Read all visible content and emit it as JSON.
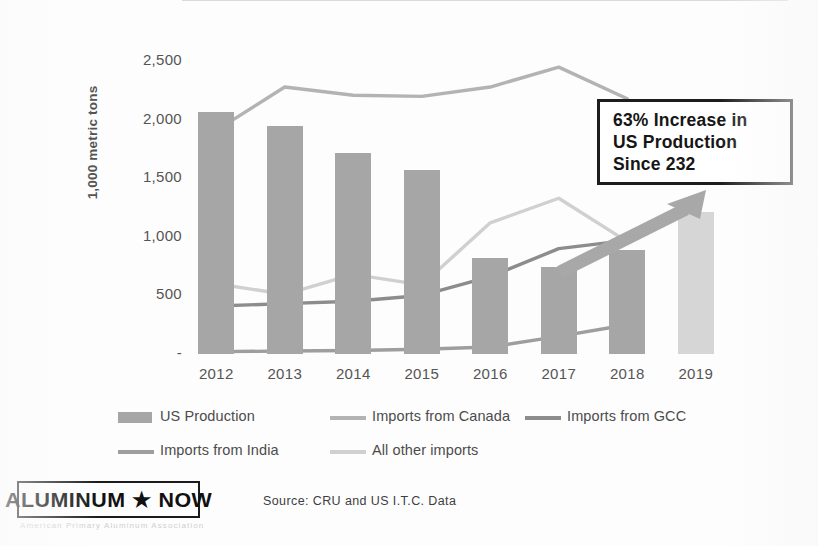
{
  "colors": {
    "us_production_bar": "#a6a6a6",
    "us_production_bar_2019": "#d6d6d6",
    "canada_line": "#b3b3b3",
    "gcc_line": "#8c8c8c",
    "india_line": "#9e9e9e",
    "all_other_line": "#d0d0d0",
    "arrow": "#a8a8a8",
    "callout_border": "#1d1d1d",
    "background": "#ffffff",
    "axis": "#d9d9d9"
  },
  "callout": {
    "line1": "63% Increase in",
    "line2": "US Production",
    "line3": "Since 232"
  },
  "footer": {
    "logo": "ALUMINUM ★ NOW",
    "logo_subtitle": "American Primary Aluminum Association",
    "source": "Source: CRU and US I.T.C. Data"
  },
  "chart_data": {
    "type": "bar",
    "title": "",
    "xlabel": "",
    "ylabel": "1,000 metric tons",
    "ylim": [
      0,
      2750
    ],
    "yticks": [
      "-",
      "500",
      "1,000",
      "1,500",
      "2,000",
      "2,500"
    ],
    "ytick_values": [
      0,
      500,
      1000,
      1500,
      2000,
      2500
    ],
    "grid": false,
    "legend_position": "bottom",
    "categories": [
      "2012",
      "2013",
      "2014",
      "2015",
      "2016",
      "2017",
      "2018",
      "2019"
    ],
    "series": [
      {
        "name": "US Production",
        "type": "bar",
        "color": "#a6a6a6",
        "values": [
          2070,
          1945,
          1720,
          1575,
          820,
          740,
          890,
          1210
        ],
        "note": "2019 bar is shown in a lighter shade (projected)"
      },
      {
        "name": "Imports from Canada",
        "type": "line",
        "color": "#b3b3b3",
        "values": [
          1910,
          2280,
          2210,
          2200,
          2280,
          2450,
          2180,
          null
        ]
      },
      {
        "name": "Imports from GCC",
        "type": "line",
        "color": "#8c8c8c",
        "values": [
          410,
          430,
          450,
          500,
          660,
          900,
          970,
          null
        ]
      },
      {
        "name": "Imports from India",
        "type": "line",
        "color": "#9e9e9e",
        "values": [
          20,
          25,
          30,
          40,
          60,
          150,
          250,
          null
        ]
      },
      {
        "name": "All other imports",
        "type": "line",
        "color": "#d0d0d0",
        "values": [
          600,
          510,
          680,
          590,
          1120,
          1330,
          960,
          null
        ]
      }
    ],
    "annotations": [
      {
        "name": "increase-arrow",
        "text": "",
        "from": "2017",
        "to": "2019"
      },
      {
        "name": "callout-box",
        "text": "63% Increase in US Production Since 232"
      }
    ]
  },
  "legend": [
    {
      "label": "US Production",
      "marker": "bar",
      "color": "#a6a6a6"
    },
    {
      "label": "Imports from Canada",
      "marker": "line",
      "color": "#b3b3b3"
    },
    {
      "label": "Imports from GCC",
      "marker": "line",
      "color": "#8c8c8c"
    },
    {
      "label": "Imports from India",
      "marker": "line",
      "color": "#9e9e9e"
    },
    {
      "label": "All other imports",
      "marker": "line",
      "color": "#d0d0d0"
    }
  ]
}
